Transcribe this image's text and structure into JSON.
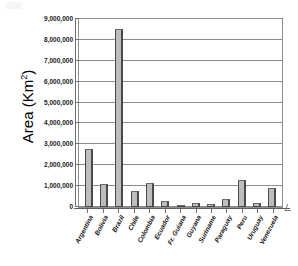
{
  "chart_data": {
    "type": "bar",
    "title": "",
    "subtitle": "",
    "xlabel": "",
    "ylabel": "Area (Km2)",
    "ylabel_base": "Area (Km",
    "ylabel_sup": "2",
    "ylabel_close": ")",
    "categories": [
      "Argentina",
      "Bolivia",
      "Brazil",
      "Chile",
      "Colombia",
      "Ecuador",
      "Fr. Guiana",
      "Guyana",
      "Suriname",
      "Paraguay",
      "Peru",
      "Uruguay",
      "Venezuela"
    ],
    "values": [
      2780000,
      1099000,
      8512000,
      757000,
      1139000,
      284000,
      91000,
      215000,
      163000,
      407000,
      1285000,
      176000,
      912000
    ],
    "ylim": [
      0,
      9000000
    ],
    "ytick_values": [
      0,
      1000000,
      2000000,
      3000000,
      4000000,
      5000000,
      6000000,
      7000000,
      8000000,
      9000000
    ],
    "ytick_labels": [
      "0",
      "1,000,000",
      "2,000,000",
      "3,000,000",
      "4,000,000",
      "5,000,000",
      "6,000,000",
      "7,000,000",
      "8,000,000",
      "9,000,000"
    ],
    "grid": true,
    "grid_axis": "y",
    "legend": false,
    "legend_position": "none",
    "bar_fill_color": "#bdbdbd",
    "bar_edge_color": "#4a4a4a",
    "plot_border_color": "#8e8e8e",
    "background_color": "#ffffff"
  }
}
